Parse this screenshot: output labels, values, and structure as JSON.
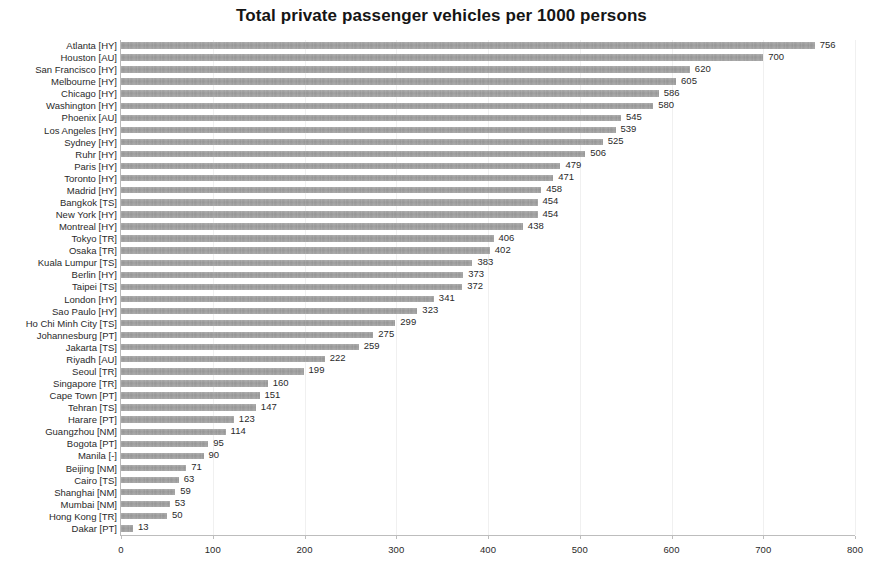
{
  "chart_data": {
    "type": "bar",
    "orientation": "horizontal",
    "title": "Total private passenger vehicles per 1000 persons",
    "xlabel": "",
    "ylabel": "",
    "xlim": [
      0,
      800
    ],
    "xticks": [
      0,
      100,
      200,
      300,
      400,
      500,
      600,
      700,
      800
    ],
    "grid": true,
    "grid_axis": "x",
    "legend": false,
    "bar_color": "#9a9a9a",
    "value_labels": true,
    "categories": [
      "Atlanta [HY]",
      "Houston [AU]",
      "San Francisco [HY]",
      "Melbourne [HY]",
      "Chicago [HY]",
      "Washington [HY]",
      "Phoenix [AU]",
      "Los Angeles [HY]",
      "Sydney [HY]",
      "Ruhr [HY]",
      "Paris [HY]",
      "Toronto [HY]",
      "Madrid [HY]",
      "Bangkok [TS]",
      "New York [HY]",
      "Montreal [HY]",
      "Tokyo [TR]",
      "Osaka [TR]",
      "Kuala Lumpur [TS]",
      "Berlin [HY]",
      "Taipei [TS]",
      "London [HY]",
      "Sao Paulo [HY]",
      "Ho Chi Minh City [TS]",
      "Johannesburg [PT]",
      "Jakarta [TS]",
      "Riyadh [AU]",
      "Seoul [TR]",
      "Singapore [TR]",
      "Cape Town [PT]",
      "Tehran [TS]",
      "Harare [PT]",
      "Guangzhou [NM]",
      "Bogota [PT]",
      "Manila [-]",
      "Beijing [NM]",
      "Cairo [TS]",
      "Shanghai [NM]",
      "Mumbai [NM]",
      "Hong Kong [TR]",
      "Dakar [PT]"
    ],
    "values": [
      756,
      700,
      620,
      605,
      586,
      580,
      545,
      539,
      525,
      506,
      479,
      471,
      458,
      454,
      454,
      438,
      406,
      402,
      383,
      373,
      372,
      341,
      323,
      299,
      275,
      259,
      222,
      199,
      160,
      151,
      147,
      123,
      114,
      95,
      90,
      71,
      63,
      59,
      53,
      50,
      13
    ]
  }
}
